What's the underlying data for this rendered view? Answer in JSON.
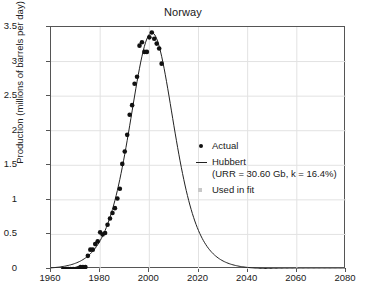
{
  "chart_data": {
    "type": "scatter",
    "title": "Norway",
    "xlabel": "",
    "ylabel": "Production (millions of barrels per day)",
    "xlim": [
      1960,
      2080
    ],
    "ylim": [
      0,
      3.5
    ],
    "xticks": [
      1960,
      1980,
      2000,
      2020,
      2040,
      2060,
      2080
    ],
    "yticks": [
      "0",
      "0.5",
      "1",
      "1.5",
      "2",
      "2.5",
      "3",
      "3.5"
    ],
    "ytick_values": [
      0,
      0.5,
      1,
      1.5,
      2,
      2.5,
      3,
      3.5
    ],
    "grid": true,
    "legend_position": "center-right",
    "series": [
      {
        "name": "Actual",
        "type": "scatter",
        "marker": "circle",
        "color": "#111111",
        "x": [
          1965,
          1966,
          1967,
          1968,
          1969,
          1970,
          1971,
          1972,
          1973,
          1974,
          1975,
          1976,
          1977,
          1978,
          1979,
          1980,
          1981,
          1982,
          1983,
          1984,
          1985,
          1986,
          1987,
          1988,
          1989,
          1990,
          1991,
          1992,
          1993,
          1994,
          1995,
          1996,
          1997,
          1998,
          1999,
          2000,
          2001,
          2002,
          2003,
          2004,
          2005
        ],
        "y": [
          0.0,
          0.0,
          0.0,
          0.0,
          0.0,
          0.0,
          0.01,
          0.03,
          0.03,
          0.03,
          0.19,
          0.28,
          0.28,
          0.36,
          0.4,
          0.53,
          0.5,
          0.52,
          0.64,
          0.73,
          0.81,
          0.88,
          1.02,
          1.16,
          1.52,
          1.7,
          1.94,
          2.23,
          2.37,
          2.68,
          2.78,
          3.23,
          3.28,
          3.14,
          3.14,
          3.35,
          3.42,
          3.33,
          3.26,
          3.19,
          2.97
        ]
      },
      {
        "name": "Hubbert",
        "type": "line",
        "color": "#222222",
        "URR_Gb": 30.6,
        "k_percent": 16.4,
        "peak_year": 2001,
        "peak_value": 3.42
      },
      {
        "name": "Used in fit",
        "type": "marker",
        "marker": "square",
        "color": "#c8c8c8"
      }
    ],
    "legend": {
      "actual_label": "Actual",
      "hubbert_label": "Hubbert",
      "hubbert_params": "(URR = 30.60 Gb, k = 16.4%)",
      "usedinfit_label": "Used in fit"
    }
  }
}
